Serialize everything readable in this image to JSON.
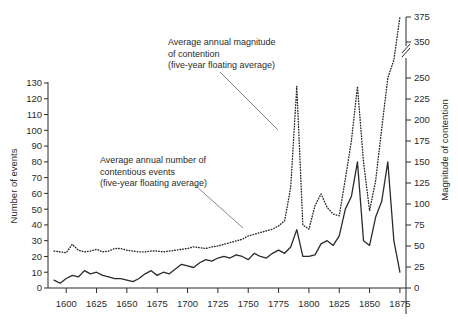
{
  "chart_data": {
    "type": "line",
    "title": "",
    "xlabel": "",
    "ylabel": "Number of events",
    "y2label": "Magnitude of contention",
    "xlim": [
      1585,
      1880
    ],
    "ylim": [
      0,
      130
    ],
    "y2lim": [
      0,
      375
    ],
    "grid": false,
    "legend_position": "none",
    "x_ticks": [
      1600,
      1625,
      1650,
      1675,
      1700,
      1725,
      1750,
      1775,
      1800,
      1825,
      1850,
      1875
    ],
    "y_ticks": [
      0,
      10,
      20,
      30,
      40,
      50,
      60,
      70,
      80,
      90,
      100,
      110,
      120,
      130
    ],
    "y2_ticks": [
      0,
      25,
      50,
      75,
      100,
      125,
      150,
      175,
      200,
      225,
      250,
      350,
      375
    ],
    "y2_axis_break": {
      "below": 250,
      "above": 350,
      "note": "axis break drawn between 250 and 350"
    },
    "annotations": [
      {
        "id": "magnitude-annotation",
        "lines": [
          "Average annual magnitude",
          "of contention",
          "(five-year floating average)"
        ],
        "x": 168,
        "y": 45,
        "leader": {
          "from_x": 220,
          "from_y": 72,
          "to_x": 278,
          "to_y": 130
        }
      },
      {
        "id": "events-annotation",
        "lines": [
          "Average annual number of",
          "contentious events",
          "(five-year floating average)"
        ],
        "x": 100,
        "y": 163,
        "leader": {
          "from_x": 196,
          "from_y": 186,
          "to_x": 243,
          "to_y": 228
        }
      }
    ],
    "series": [
      {
        "name": "Average annual magnitude of contention (five-year floating average)",
        "axis": "right",
        "style": "dotted",
        "color": "#2b2b2b",
        "x": [
          1590,
          1595,
          1600,
          1605,
          1610,
          1615,
          1620,
          1625,
          1630,
          1635,
          1640,
          1645,
          1650,
          1655,
          1660,
          1665,
          1670,
          1675,
          1680,
          1685,
          1690,
          1695,
          1700,
          1705,
          1710,
          1715,
          1720,
          1725,
          1730,
          1735,
          1740,
          1745,
          1750,
          1755,
          1760,
          1765,
          1770,
          1775,
          1780,
          1785,
          1790,
          1795,
          1800,
          1805,
          1810,
          1815,
          1820,
          1825,
          1830,
          1835,
          1840,
          1845,
          1850,
          1855,
          1860,
          1865,
          1870,
          1875
        ],
        "values": [
          44,
          43,
          42,
          52,
          45,
          43,
          44,
          46,
          43,
          44,
          47,
          47,
          45,
          44,
          43,
          43,
          44,
          44,
          43,
          44,
          45,
          46,
          47,
          49,
          48,
          47,
          49,
          50,
          52,
          54,
          56,
          58,
          62,
          64,
          66,
          68,
          70,
          74,
          80,
          120,
          240,
          75,
          70,
          98,
          112,
          96,
          88,
          86,
          130,
          175,
          240,
          150,
          92,
          128,
          190,
          250,
          300,
          375
        ]
      },
      {
        "name": "Average annual number of contentious events (five-year floating average)",
        "axis": "left",
        "style": "solid",
        "color": "#2b2b2b",
        "x": [
          1590,
          1595,
          1600,
          1605,
          1610,
          1615,
          1620,
          1625,
          1630,
          1635,
          1640,
          1645,
          1650,
          1655,
          1660,
          1665,
          1670,
          1675,
          1680,
          1685,
          1690,
          1695,
          1700,
          1705,
          1710,
          1715,
          1720,
          1725,
          1730,
          1735,
          1740,
          1745,
          1750,
          1755,
          1760,
          1765,
          1770,
          1775,
          1780,
          1785,
          1790,
          1795,
          1800,
          1805,
          1810,
          1815,
          1820,
          1825,
          1830,
          1835,
          1840,
          1845,
          1850,
          1855,
          1860,
          1865,
          1870,
          1875
        ],
        "values": [
          5,
          3,
          6,
          8,
          7,
          11,
          9,
          10,
          8,
          7,
          6,
          6,
          5,
          4,
          6,
          9,
          11,
          8,
          10,
          9,
          12,
          15,
          14,
          13,
          16,
          18,
          17,
          19,
          20,
          19,
          21,
          20,
          18,
          22,
          20,
          19,
          22,
          24,
          22,
          26,
          37,
          20,
          20,
          21,
          28,
          30,
          27,
          33,
          50,
          58,
          80,
          30,
          27,
          45,
          55,
          80,
          30,
          10
        ]
      }
    ]
  },
  "axes": {
    "left_title": "Number of events",
    "right_title": "Magnitude of contention"
  }
}
